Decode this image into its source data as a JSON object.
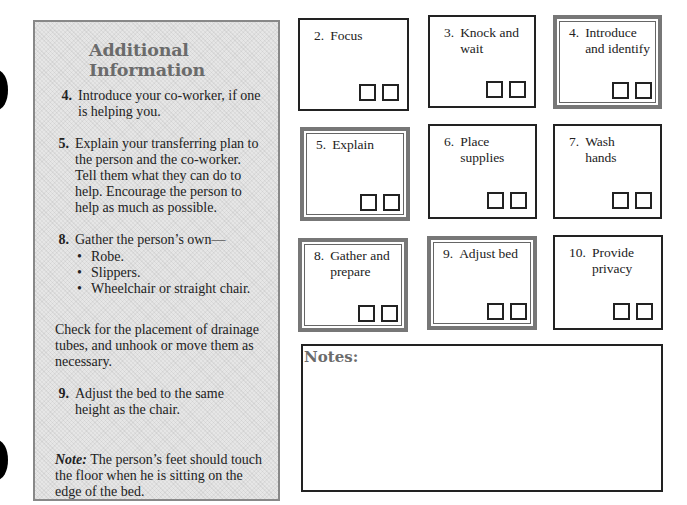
{
  "info_panel": {
    "title": "Additional Information",
    "steps": [
      {
        "number": "4.",
        "text": "Introduce your co-worker, if one is helping you."
      },
      {
        "number": "5.",
        "text": "Explain your transferring plan to the person and the co-worker. Tell them what they can do to help. Encourage the person to help as much as possible."
      },
      {
        "number": "8.",
        "text": "Gather the person’s own—",
        "bullets": [
          "Robe.",
          "Slippers.",
          "Wheelchair or straight chair."
        ]
      },
      {
        "number": "9.",
        "text": "Adjust the bed to the same height as the chair."
      }
    ],
    "drainage_text": "Check for the placement of drainage tubes, and unhook or move them as necessary.",
    "note_label": "Note:",
    "note_text": " The person’s feet should touch the floor when he is sitting on the edge of the bed."
  },
  "cards": [
    {
      "number": "2.",
      "label": "Focus",
      "style": "single"
    },
    {
      "number": "3.",
      "label": "Knock and wait",
      "style": "single"
    },
    {
      "number": "4.",
      "label": "Introduce and identify",
      "style": "double"
    },
    {
      "number": "5.",
      "label": "Explain",
      "style": "double"
    },
    {
      "number": "6.",
      "label": "Place supplies",
      "style": "single"
    },
    {
      "number": "7.",
      "label": "Wash hands",
      "style": "single"
    },
    {
      "number": "8.",
      "label": "Gather and prepare",
      "style": "double"
    },
    {
      "number": "9.",
      "label": "Adjust bed",
      "style": "double"
    },
    {
      "number": "10.",
      "label": "Provide privacy",
      "style": "single"
    }
  ],
  "notes": {
    "label": "Notes:",
    "value": ""
  }
}
